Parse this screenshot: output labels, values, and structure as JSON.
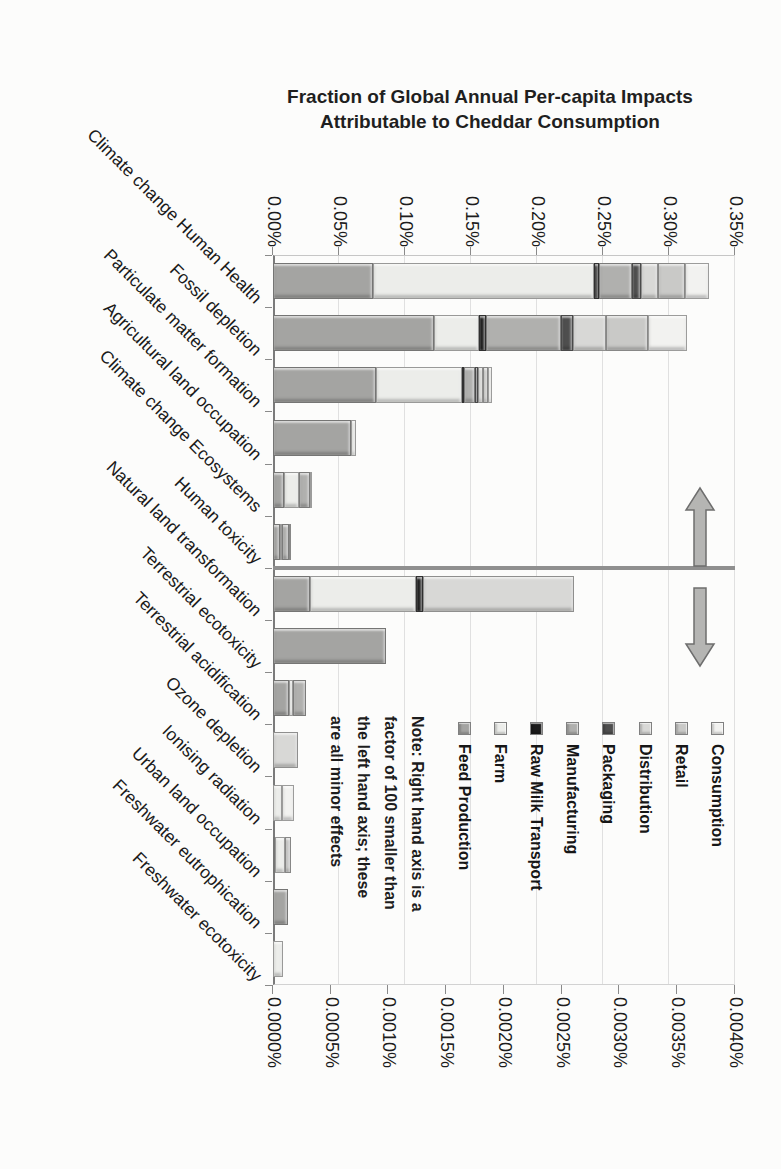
{
  "chart_data": {
    "type": "bar",
    "stacked": true,
    "presentation": "landscape stacked column chart rotated 90 degrees clockwise on a portrait page; title remains horizontal",
    "title": {
      "line1": "Fraction of Global Annual Per-capita Impacts",
      "line2": "Attributable to Cheddar Consumption"
    },
    "left_axis": {
      "range": [
        0,
        0.35
      ],
      "unit": "%",
      "tick_labels": [
        "0.00%",
        "0.05%",
        "0.10%",
        "0.15%",
        "0.20%",
        "0.25%",
        "0.30%",
        "0.35%"
      ],
      "gridlines": true
    },
    "right_axis": {
      "range": [
        0,
        0.004
      ],
      "unit": "%",
      "tick_labels": [
        "0.0000%",
        "0.0005%",
        "0.0010%",
        "0.0015%",
        "0.0020%",
        "0.0025%",
        "0.0030%",
        "0.0035%",
        "0.0040%"
      ],
      "gridlines": false
    },
    "series_order": [
      "Feed Production",
      "Farm",
      "Raw Milk Transport",
      "Manufacturing",
      "Packaging",
      "Distribution",
      "Retail",
      "Consumption"
    ],
    "series_colors": {
      "Feed Production": "#a4a4a2",
      "Farm": "#ecedea",
      "Raw Milk Transport": "#1b1b1b",
      "Manufacturing": "#b0b0ae",
      "Packaging": "#4e4e4e",
      "Distribution": "#d8d8d6",
      "Retail": "#c9c9c7",
      "Consumption": "#f2f2f0"
    },
    "legend_top_to_bottom": [
      "Consumption",
      "Retail",
      "Distribution",
      "Packaging",
      "Manufacturing",
      "Raw Milk Transport",
      "Farm",
      "Feed Production"
    ],
    "note_lines": [
      "Note: Right hand axis is a",
      "factor of 100 smaller than",
      "the left hand axis; these",
      "are all minor effects"
    ],
    "divider_between": [
      "Human toxicity",
      "Natural land transformation"
    ],
    "divider_color": "#8f8f8f",
    "arrow_color": "#b5b5b3",
    "categories": [
      "Climate change Human Health",
      "Fossil depletion",
      "Particulate matter formation",
      "Agricultural land occupation",
      "Climate change Ecosystems",
      "Human toxicity",
      "Natural land transformation",
      "Terrestrial ecotoxicity",
      "Terrestrial acidification",
      "Ozone depletion",
      "Ionising radiation",
      "Urban land occupation",
      "Freshwater eutrophication",
      "Freshwater ecotoxicity"
    ],
    "rows": [
      {
        "category": "Climate change Human Health",
        "axis": "left",
        "total": 0.33,
        "segments": {
          "Feed Production": 0.076,
          "Farm": 0.167,
          "Raw Milk Transport": 0.004,
          "Manufacturing": 0.025,
          "Packaging": 0.007,
          "Distribution": 0.013,
          "Retail": 0.02,
          "Consumption": 0.018
        }
      },
      {
        "category": "Fossil depletion",
        "axis": "left",
        "total": 0.314,
        "segments": {
          "Feed Production": 0.122,
          "Farm": 0.034,
          "Raw Milk Transport": 0.005,
          "Manufacturing": 0.057,
          "Packaging": 0.009,
          "Distribution": 0.025,
          "Retail": 0.032,
          "Consumption": 0.03
        }
      },
      {
        "category": "Particulate matter formation",
        "axis": "left",
        "total": 0.166,
        "segments": {
          "Feed Production": 0.078,
          "Farm": 0.065,
          "Raw Milk Transport": 0.002,
          "Manufacturing": 0.008,
          "Packaging": 0.002,
          "Distribution": 0.004,
          "Retail": 0.004,
          "Consumption": 0.003
        }
      },
      {
        "category": "Agricultural land occupation",
        "axis": "left",
        "total": 0.063,
        "segments": {
          "Feed Production": 0.059,
          "Farm": 0.004
        }
      },
      {
        "category": "Climate change Ecosystems",
        "axis": "left",
        "total": 0.029,
        "segments": {
          "Feed Production": 0.008,
          "Farm": 0.012,
          "Manufacturing": 0.008,
          "Consumption": 0.001
        }
      },
      {
        "category": "Human toxicity",
        "axis": "left",
        "total": 0.014,
        "segments": {
          "Feed Production": 0.005,
          "Farm": 0.002,
          "Manufacturing": 0.005,
          "Retail": 0.002
        }
      },
      {
        "category": "Natural land transformation",
        "axis": "right",
        "total": 0.00261,
        "segments": {
          "Feed Production": 0.00032,
          "Farm": 0.00092,
          "Raw Milk Transport": 6e-05,
          "Distribution": 0.00131
        }
      },
      {
        "category": "Terrestrial ecotoxicity",
        "axis": "right",
        "total": 0.00098,
        "segments": {
          "Feed Production": 0.00098
        }
      },
      {
        "category": "Terrestrial acidification",
        "axis": "right",
        "total": 0.00029,
        "segments": {
          "Feed Production": 0.00014,
          "Farm": 3e-05,
          "Manufacturing": 0.00012
        }
      },
      {
        "category": "Ozone depletion",
        "axis": "right",
        "total": 0.00022,
        "segments": {
          "Distribution": 0.00022
        }
      },
      {
        "category": "Ionising radiation",
        "axis": "right",
        "total": 0.00018,
        "segments": {
          "Farm": 8e-05,
          "Consumption": 0.0001
        }
      },
      {
        "category": "Urban land occupation",
        "axis": "right",
        "total": 0.00016,
        "segments": {
          "Feed Production": 2e-05,
          "Farm": 8e-05,
          "Retail": 6e-05
        }
      },
      {
        "category": "Freshwater eutrophication",
        "axis": "right",
        "total": 0.00013,
        "segments": {
          "Feed Production": 0.00013
        }
      },
      {
        "category": "Freshwater ecotoxicity",
        "axis": "right",
        "total": 9e-05,
        "segments": {
          "Farm": 9e-05
        }
      }
    ]
  }
}
